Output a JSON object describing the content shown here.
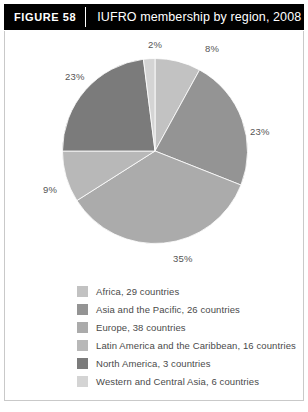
{
  "header": {
    "figure_tag": "FIGURE 58",
    "title": "IUFRO membership by region, 2008"
  },
  "chart_data": {
    "type": "pie",
    "title": "IUFRO membership by region, 2008",
    "categories": [
      "Africa",
      "Asia and the Pacific",
      "Europe",
      "Latin America and the Caribbean",
      "North America",
      "Western and Central Asia"
    ],
    "values": [
      8,
      23,
      35,
      9,
      23,
      2
    ],
    "value_labels": [
      "8%",
      "23%",
      "35%",
      "9%",
      "23%",
      "2%"
    ],
    "counts": [
      29,
      26,
      38,
      16,
      3,
      6
    ],
    "colors": [
      "#c2c2c2",
      "#949494",
      "#ababab",
      "#b8b8b8",
      "#7b7b7b",
      "#d4d4d4"
    ],
    "unit": "%",
    "start_angle": 0,
    "direction": "clockwise",
    "legend_position": "bottom",
    "grid": false
  },
  "labels": [
    {
      "text": "2%",
      "x": 143,
      "y": 8
    },
    {
      "text": "8%",
      "x": 200,
      "y": 12
    },
    {
      "text": "23%",
      "x": 60,
      "y": 40
    },
    {
      "text": "23%",
      "x": 245,
      "y": 95
    },
    {
      "text": "9%",
      "x": 38,
      "y": 153
    },
    {
      "text": "35%",
      "x": 168,
      "y": 222
    }
  ],
  "legend": {
    "items": [
      {
        "label": "Africa, 29 countries",
        "color": "#c2c2c2"
      },
      {
        "label": "Asia and the Pacific, 26 countries",
        "color": "#949494"
      },
      {
        "label": "Europe, 38 countries",
        "color": "#ababab"
      },
      {
        "label": "Latin America and the Caribbean, 16 countries",
        "color": "#b8b8b8"
      },
      {
        "label": "North America, 3 countries",
        "color": "#7b7b7b"
      },
      {
        "label": "Western and Central Asia, 6 countries",
        "color": "#d4d4d4"
      }
    ]
  }
}
